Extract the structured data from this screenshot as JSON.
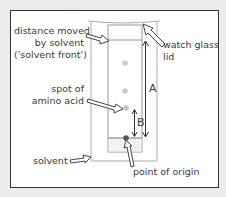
{
  "diagram": {
    "labels": {
      "solvent_front_line1": "distance moved",
      "solvent_front_line2": "by solvent",
      "solvent_front_line3": "('solvent front')",
      "spot_line1": "spot of",
      "spot_line2": "amino acid",
      "solvent": "solvent",
      "origin": "point of origin",
      "lid_line1": "watch glass",
      "lid_line2": "lid",
      "distance_a": "A",
      "distance_b": "B"
    },
    "colors": {
      "frame_border": "#333333",
      "background": "#ececec",
      "paper": "#ffffff",
      "spot": "#c8c8c8",
      "origin_dot": "#555555",
      "solvent_fill": "#f2f2f2",
      "outline": "#999999"
    }
  }
}
